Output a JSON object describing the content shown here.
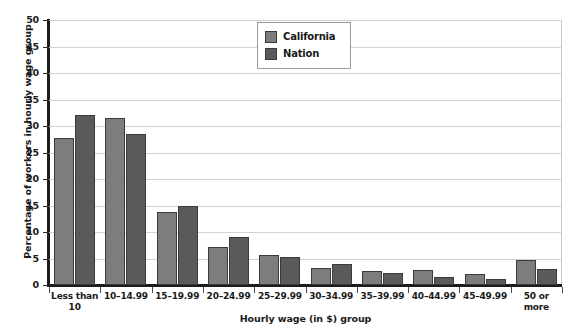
{
  "chart_data": {
    "type": "bar",
    "title": "",
    "xlabel": "Hourly wage (in $) group",
    "ylabel": "Percentage of workers in hourly wage group",
    "categories": [
      "Less than\n10",
      "10–14.99",
      "15–19.99",
      "20–24.99",
      "25–29.99",
      "30–34.99",
      "35–39.99",
      "40–44.99",
      "45–49.99",
      "50 or\nmore"
    ],
    "series": [
      {
        "name": "California",
        "color": "#7d7d7d",
        "values": [
          27.8,
          31.5,
          13.8,
          7.1,
          5.6,
          3.3,
          2.7,
          2.8,
          2.0,
          4.7
        ]
      },
      {
        "name": "Nation",
        "color": "#5a5a5a",
        "values": [
          32.0,
          28.4,
          14.9,
          9.0,
          5.3,
          3.9,
          2.3,
          1.6,
          1.2,
          3.0
        ]
      }
    ],
    "ylim": [
      0,
      50
    ],
    "yticks": [
      0,
      5,
      10,
      15,
      20,
      25,
      30,
      35,
      40,
      45,
      50
    ],
    "ytick_labels": [
      "0",
      "5",
      "10",
      "15",
      "20",
      "25",
      "30",
      "35",
      "40",
      "45",
      "50"
    ],
    "grid": true,
    "legend_position": "top-center"
  }
}
